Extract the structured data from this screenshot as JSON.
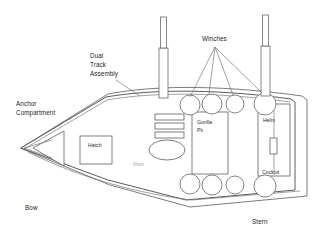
{
  "diagram": {
    "line_color": "#5a5a5a",
    "background_color": "#ffffff",
    "text_color": "#1c1c1c"
  },
  "labels": {
    "winches": "Winches",
    "dual_track_assembly": "Dual\nTrack\nAssembly",
    "dual_track_line1": "Dual",
    "dual_track_line2": "Track",
    "dual_track_line3": "Assembly",
    "anchor_compartment_line1": "Anchor",
    "anchor_compartment_line2": "Compartment",
    "hatch": "Hatch",
    "gorilla_pit_line1": "Gorilla",
    "gorilla_pit_line2": "Pit",
    "helm": "Helm",
    "cockpit": "Cockpit",
    "bow": "Bow",
    "stern": "Stern",
    "faint_unreadable": "Mast"
  },
  "components": {
    "masts": [
      {
        "name": "forward-mast",
        "x": 163,
        "base_y": 98,
        "top_y": 18
      },
      {
        "name": "aft-mast",
        "x": 265,
        "base_y": 94,
        "top_y": 16
      }
    ],
    "winch_count_upper": 4,
    "winch_count_lower": 4,
    "winch_leader_targets": 4,
    "track_bars": 3,
    "has_hatch": true,
    "has_gorilla_pit": true,
    "has_cockpit_well": true,
    "has_anchor_compartment": true
  }
}
